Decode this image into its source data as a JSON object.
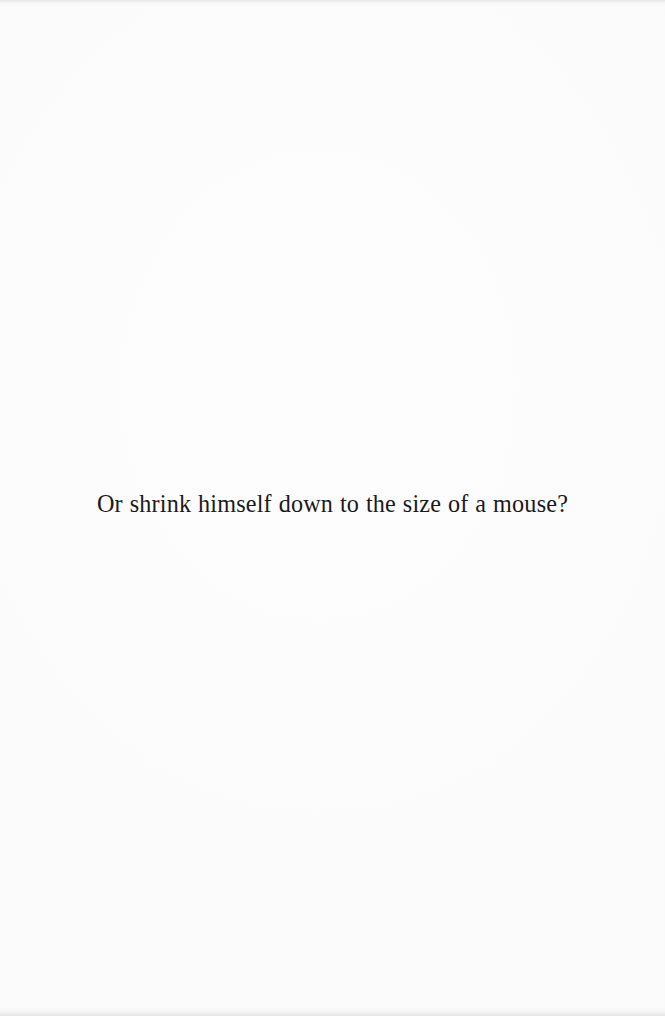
{
  "page": {
    "kind": "scanned-book-page",
    "background_color": "#fdfdfd",
    "ink_color": "#1a1a1a",
    "width_px": 665,
    "height_px": 1016
  },
  "content": {
    "body_line": "Or shrink himself down to the size of a mouse?"
  }
}
